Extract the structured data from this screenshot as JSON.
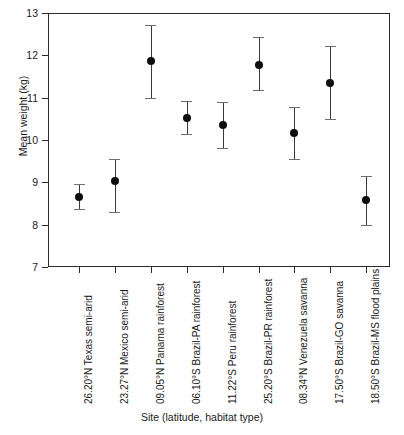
{
  "chart_data": {
    "type": "scatter",
    "title": "",
    "xlabel": "Site (latitude, habitat type)",
    "ylabel": "Mean weight (kg)",
    "ylim": [
      7,
      13
    ],
    "yticks": [
      7,
      8,
      9,
      10,
      11,
      12,
      13
    ],
    "grid": false,
    "legend": "none",
    "error_bars": "vertical, capped",
    "categories": [
      "26.20°N Texas semi-arid",
      "23.27°N Mexico semi-arid",
      "09.05°N Panama rainforest",
      "06.10°S Brazil-PA rainforest",
      "11.22°S Peru rainforest",
      "25.20°S Brazil-PR rainforest",
      "08.34°N Venezuela savanna",
      "17.50°S Brazil-GO savanna",
      "18.50°S Brazil-MS flood plains"
    ],
    "values": [
      8.66,
      9.02,
      11.87,
      10.52,
      10.35,
      11.78,
      10.17,
      11.35,
      8.58
    ],
    "err_low": [
      8.36,
      8.31,
      11.0,
      10.13,
      9.8,
      11.19,
      9.56,
      10.49,
      8.0
    ],
    "err_high": [
      8.97,
      9.56,
      12.72,
      10.93,
      10.9,
      12.43,
      10.78,
      12.22,
      9.15
    ],
    "marker_color": "#0d0d0d",
    "errorbar_color": "#3a3a3a",
    "axis_color": "#2b2b2b"
  }
}
